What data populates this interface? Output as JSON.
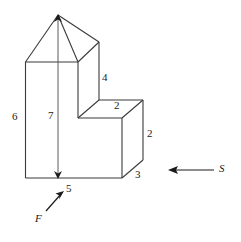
{
  "figure": {
    "stroke_color": "#3a3a3a",
    "background_color": "#ffffff",
    "text_color": "#1a1a1a"
  },
  "dimension_labels": {
    "left_height": "6",
    "total_height": "7",
    "upper_right_height": "4",
    "step_top_depth": "2",
    "step_right_height": "2",
    "base_depth": "3",
    "base_width": "5"
  },
  "view_markers": {
    "front_label": "F",
    "side_label": "S"
  }
}
